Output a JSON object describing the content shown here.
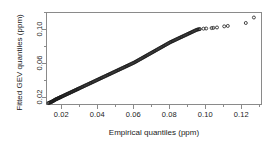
{
  "chart_data": {
    "type": "scatter",
    "title": "",
    "xlabel": "Empirical quantiles (ppm)",
    "ylabel": "Fitted GEV quantiles (ppm)",
    "xlim": [
      0.0115,
      0.1315
    ],
    "ylim": [
      0.0105,
      0.1205
    ],
    "grid": false,
    "legend": null,
    "marker": "open-circle",
    "marker_color": "#1a1a1a",
    "xticks": [
      0.02,
      0.04,
      0.06,
      0.08,
      0.1,
      0.12
    ],
    "xtick_labels": [
      "0.02",
      "0.04",
      "0.06",
      "0.08",
      "0.10",
      "0.12"
    ],
    "xticks_minor": [
      0.03,
      0.05,
      0.07,
      0.09,
      0.11,
      0.13
    ],
    "yticks": [
      0.02,
      0.06,
      0.1
    ],
    "ytick_labels": [
      "0.02",
      "0.06",
      "0.10"
    ],
    "yticks_minor": [
      0.04,
      0.08,
      0.12
    ],
    "series": [
      {
        "name": "GEV quantile-quantile points",
        "x": [
          0.0128,
          0.0132,
          0.0136,
          0.014,
          0.0143,
          0.0146,
          0.0149,
          0.0152,
          0.0155,
          0.0158,
          0.0161,
          0.0164,
          0.0167,
          0.017,
          0.0173,
          0.0176,
          0.0179,
          0.0182,
          0.0185,
          0.0188,
          0.0191,
          0.0194,
          0.0197,
          0.02,
          0.0204,
          0.0208,
          0.0212,
          0.0216,
          0.022,
          0.0224,
          0.0228,
          0.0232,
          0.0236,
          0.024,
          0.0244,
          0.0248,
          0.0252,
          0.0256,
          0.026,
          0.0264,
          0.0268,
          0.0272,
          0.0276,
          0.028,
          0.0284,
          0.0288,
          0.0292,
          0.0296,
          0.03,
          0.0305,
          0.031,
          0.0315,
          0.032,
          0.0325,
          0.033,
          0.0335,
          0.034,
          0.0345,
          0.035,
          0.0355,
          0.036,
          0.0365,
          0.037,
          0.0375,
          0.038,
          0.0385,
          0.039,
          0.0395,
          0.04,
          0.0405,
          0.041,
          0.0415,
          0.042,
          0.0425,
          0.043,
          0.0435,
          0.044,
          0.0445,
          0.045,
          0.0455,
          0.046,
          0.0465,
          0.047,
          0.0475,
          0.048,
          0.0485,
          0.049,
          0.0495,
          0.05,
          0.0505,
          0.051,
          0.0515,
          0.052,
          0.0525,
          0.053,
          0.0535,
          0.054,
          0.0545,
          0.055,
          0.0555,
          0.056,
          0.0565,
          0.057,
          0.0575,
          0.058,
          0.0585,
          0.059,
          0.0595,
          0.06,
          0.0605,
          0.061,
          0.0615,
          0.062,
          0.0625,
          0.063,
          0.0635,
          0.064,
          0.0645,
          0.065,
          0.0655,
          0.066,
          0.0665,
          0.067,
          0.0675,
          0.068,
          0.0685,
          0.069,
          0.0695,
          0.07,
          0.0705,
          0.071,
          0.0715,
          0.072,
          0.0725,
          0.073,
          0.0735,
          0.074,
          0.0745,
          0.075,
          0.0755,
          0.076,
          0.0765,
          0.077,
          0.0775,
          0.078,
          0.0785,
          0.079,
          0.0795,
          0.08,
          0.0805,
          0.081,
          0.0815,
          0.082,
          0.0825,
          0.083,
          0.0835,
          0.084,
          0.0845,
          0.085,
          0.0855,
          0.086,
          0.0865,
          0.087,
          0.0875,
          0.088,
          0.0885,
          0.089,
          0.0895,
          0.09,
          0.0905,
          0.091,
          0.0915,
          0.092,
          0.0925,
          0.093,
          0.0935,
          0.094,
          0.0945,
          0.095,
          0.0955,
          0.096,
          0.0965,
          0.097,
          0.099,
          0.1005,
          0.1035,
          0.1045,
          0.1065,
          0.1105,
          0.1125,
          0.1225,
          0.127
        ],
        "y": [
          0.0128,
          0.0131,
          0.0134,
          0.0137,
          0.014,
          0.0143,
          0.0146,
          0.0149,
          0.0153,
          0.0157,
          0.0161,
          0.0165,
          0.0169,
          0.0172,
          0.0175,
          0.0178,
          0.0181,
          0.0184,
          0.0187,
          0.019,
          0.0193,
          0.0196,
          0.0199,
          0.0202,
          0.0206,
          0.021,
          0.0214,
          0.0218,
          0.0222,
          0.0226,
          0.023,
          0.0234,
          0.0238,
          0.0242,
          0.0246,
          0.025,
          0.0254,
          0.0258,
          0.0262,
          0.0266,
          0.027,
          0.0274,
          0.0278,
          0.0282,
          0.0286,
          0.029,
          0.0294,
          0.0298,
          0.0302,
          0.0307,
          0.0312,
          0.0317,
          0.0322,
          0.0327,
          0.0332,
          0.0337,
          0.0342,
          0.0347,
          0.0352,
          0.0357,
          0.0362,
          0.0367,
          0.0372,
          0.0377,
          0.0382,
          0.0387,
          0.0392,
          0.0397,
          0.0402,
          0.0407,
          0.0412,
          0.0417,
          0.0422,
          0.0427,
          0.0432,
          0.0437,
          0.0442,
          0.0447,
          0.0452,
          0.0457,
          0.0462,
          0.0467,
          0.0472,
          0.0477,
          0.0482,
          0.0487,
          0.0492,
          0.0497,
          0.0502,
          0.0507,
          0.0512,
          0.0517,
          0.0522,
          0.0527,
          0.0532,
          0.0537,
          0.0542,
          0.0547,
          0.0552,
          0.0557,
          0.0562,
          0.0567,
          0.0572,
          0.0577,
          0.0582,
          0.0587,
          0.0592,
          0.0597,
          0.0602,
          0.0607,
          0.0613,
          0.0619,
          0.0625,
          0.0631,
          0.0637,
          0.0643,
          0.0649,
          0.0655,
          0.0661,
          0.0667,
          0.0673,
          0.0679,
          0.0685,
          0.0691,
          0.0697,
          0.0703,
          0.0709,
          0.0715,
          0.0721,
          0.0727,
          0.0733,
          0.0739,
          0.0745,
          0.0751,
          0.0757,
          0.0763,
          0.0769,
          0.0775,
          0.0781,
          0.0787,
          0.0793,
          0.0799,
          0.0805,
          0.0811,
          0.0817,
          0.0823,
          0.0829,
          0.0835,
          0.0841,
          0.0847,
          0.0852,
          0.0857,
          0.0862,
          0.0867,
          0.0872,
          0.0877,
          0.0882,
          0.0887,
          0.0892,
          0.0897,
          0.0902,
          0.0907,
          0.0912,
          0.0917,
          0.0922,
          0.0927,
          0.0932,
          0.0937,
          0.0942,
          0.0947,
          0.0952,
          0.0957,
          0.0962,
          0.0967,
          0.0972,
          0.0977,
          0.0982,
          0.0987,
          0.0992,
          0.0996,
          0.0999,
          0.1001,
          0.1003,
          0.1008,
          0.101,
          0.1015,
          0.1017,
          0.1022,
          0.1035,
          0.104,
          0.1075,
          0.114
        ]
      }
    ]
  }
}
